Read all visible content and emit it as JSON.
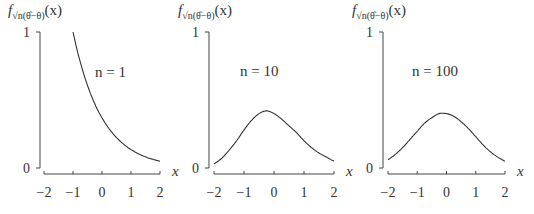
{
  "chart_data": [
    {
      "type": "line",
      "title": "",
      "ylabel": "f_{√n(θ̂−θ)}(x)",
      "xlabel": "x",
      "annotation": "n = 1",
      "xlim": [
        -2,
        2
      ],
      "ylim": [
        0,
        1
      ],
      "xticks": [
        "−2",
        "−1",
        "0",
        "1",
        "2"
      ],
      "yticks": [
        "0",
        "1"
      ],
      "grid": false,
      "x": [
        -1.0,
        -0.75,
        -0.5,
        -0.25,
        0.0,
        0.25,
        0.5,
        0.75,
        1.0,
        1.25,
        1.5,
        1.75,
        2.0
      ],
      "values": [
        1.0,
        0.78,
        0.61,
        0.47,
        0.37,
        0.29,
        0.22,
        0.17,
        0.14,
        0.11,
        0.08,
        0.06,
        0.05
      ]
    },
    {
      "type": "line",
      "title": "",
      "ylabel": "f_{√n(θ̂−θ)}(x)",
      "xlabel": "x",
      "annotation": "n = 10",
      "xlim": [
        -2,
        2
      ],
      "ylim": [
        0,
        1
      ],
      "xticks": [
        "−2",
        "−1",
        "0",
        "1",
        "2"
      ],
      "yticks": [
        "0",
        "1"
      ],
      "grid": false,
      "x": [
        -2.0,
        -1.75,
        -1.5,
        -1.25,
        -1.0,
        -0.75,
        -0.5,
        -0.25,
        0.0,
        0.25,
        0.5,
        0.75,
        1.0,
        1.25,
        1.5,
        1.75,
        2.0
      ],
      "values": [
        0.03,
        0.07,
        0.13,
        0.2,
        0.28,
        0.35,
        0.4,
        0.42,
        0.4,
        0.36,
        0.31,
        0.26,
        0.2,
        0.15,
        0.11,
        0.08,
        0.05
      ]
    },
    {
      "type": "line",
      "title": "",
      "ylabel": "f_{√n(θ̂−θ)}(x)",
      "xlabel": "x",
      "annotation": "n = 100",
      "xlim": [
        -2,
        2
      ],
      "ylim": [
        0,
        1
      ],
      "xticks": [
        "−2",
        "−1",
        "0",
        "1",
        "2"
      ],
      "yticks": [
        "0",
        "1"
      ],
      "grid": false,
      "x": [
        -2.0,
        -1.75,
        -1.5,
        -1.25,
        -1.0,
        -0.75,
        -0.5,
        -0.25,
        0.0,
        0.25,
        0.5,
        0.75,
        1.0,
        1.25,
        1.5,
        1.75,
        2.0
      ],
      "values": [
        0.06,
        0.1,
        0.15,
        0.21,
        0.27,
        0.33,
        0.37,
        0.4,
        0.4,
        0.38,
        0.34,
        0.29,
        0.23,
        0.17,
        0.12,
        0.08,
        0.05
      ]
    }
  ],
  "panels": [
    {
      "f": "f",
      "sub": "√n(θ̂−θ)",
      "arg": "(x)",
      "annotation": "n = 1",
      "xlabel": "x",
      "y0": "0",
      "y1": "1",
      "xticks": [
        "−2",
        "−1",
        "0",
        "1",
        "2"
      ]
    },
    {
      "f": "f",
      "sub": "√n(θ̂−θ)",
      "arg": "(x)",
      "annotation": "n = 10",
      "xlabel": "x",
      "y0": "0",
      "y1": "1",
      "xticks": [
        "−2",
        "−1",
        "0",
        "1",
        "2"
      ]
    },
    {
      "f": "f",
      "sub": "√n(θ̂−θ)",
      "arg": "(x)",
      "annotation": "n = 100",
      "xlabel": "x",
      "y0": "0",
      "y1": "1",
      "xticks": [
        "−2",
        "−1",
        "0",
        "1",
        "2"
      ]
    }
  ],
  "style": {
    "line_color": "#333333",
    "axis_color": "#444444"
  }
}
